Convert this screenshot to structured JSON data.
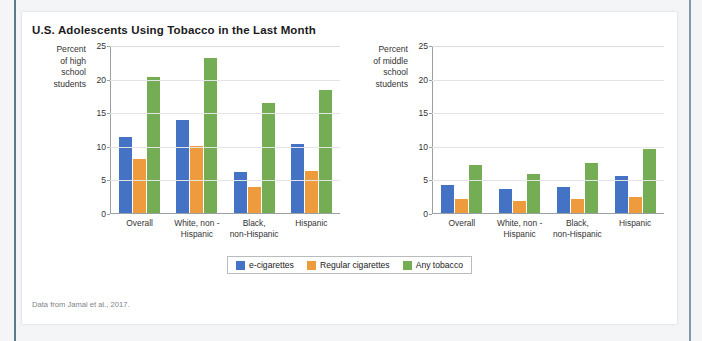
{
  "figure": {
    "title": "U.S. Adolescents Using Tobacco in the Last Month",
    "source": "Data from Jamal et al., 2017."
  },
  "legend": {
    "items": [
      {
        "label": "e-cigarettes",
        "color": "#4472c4"
      },
      {
        "label": "Regular cigarettes",
        "color": "#ed9b3c"
      },
      {
        "label": "Any tobacco",
        "color": "#74ad54"
      }
    ]
  },
  "axis": {
    "ticks": [
      "25",
      "20",
      "15",
      "10",
      "5",
      "0"
    ]
  },
  "chart_data": [
    {
      "type": "bar",
      "title": "U.S. Adolescents Using Tobacco in the Last Month",
      "ylabel": "Percent of high school students",
      "ylabel_lines": [
        "Percent",
        "of high",
        "school",
        "students"
      ],
      "xlabel": "",
      "ylim": [
        0,
        25
      ],
      "yticks": [
        0,
        5,
        10,
        15,
        20,
        25
      ],
      "grid": true,
      "legend_position": "bottom-center",
      "categories": [
        "Overall",
        "White, non - Hispanic",
        "Black, non-Hispanic",
        "Hispanic"
      ],
      "category_lines": [
        [
          "Overall"
        ],
        [
          "White, non -",
          "Hispanic"
        ],
        [
          "Black,",
          "non-Hispanic"
        ],
        [
          "Hispanic"
        ]
      ],
      "series": [
        {
          "name": "e-cigarettes",
          "color": "#4472c4",
          "values": [
            11.3,
            13.8,
            6.1,
            10.3
          ]
        },
        {
          "name": "Regular cigarettes",
          "color": "#ed9b3c",
          "values": [
            8.0,
            10.0,
            3.8,
            6.3
          ]
        },
        {
          "name": "Any tobacco",
          "color": "#74ad54",
          "values": [
            20.2,
            23.0,
            16.4,
            18.3
          ]
        }
      ]
    },
    {
      "type": "bar",
      "title": "",
      "ylabel": "Percent of middle school students",
      "ylabel_lines": [
        "Percent",
        "of middle",
        "school",
        "students"
      ],
      "xlabel": "",
      "ylim": [
        0,
        25
      ],
      "yticks": [
        0,
        5,
        10,
        15,
        20,
        25
      ],
      "grid": true,
      "legend_position": "bottom-center",
      "categories": [
        "Overall",
        "White, non - Hispanic",
        "Black, non-Hispanic",
        "Hispanic"
      ],
      "category_lines": [
        [
          "Overall"
        ],
        [
          "White, non -",
          "Hispanic"
        ],
        [
          "Black,",
          "non-Hispanic"
        ],
        [
          "Hispanic"
        ]
      ],
      "series": [
        {
          "name": "e-cigarettes",
          "color": "#4472c4",
          "values": [
            4.2,
            3.6,
            3.9,
            5.5
          ]
        },
        {
          "name": "Regular cigarettes",
          "color": "#ed9b3c",
          "values": [
            2.1,
            1.8,
            2.1,
            2.4
          ]
        },
        {
          "name": "Any tobacco",
          "color": "#74ad54",
          "values": [
            7.1,
            5.8,
            7.4,
            9.5
          ]
        }
      ]
    }
  ]
}
